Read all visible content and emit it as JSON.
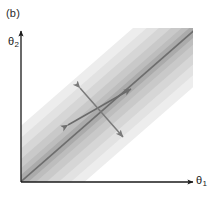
{
  "figure": {
    "panel_label": "(b)",
    "background": "#ffffff",
    "width": 214,
    "height": 198
  },
  "axes": {
    "x_label": "θ",
    "x_label_sub": "1",
    "y_label": "θ",
    "y_label_sub": "2",
    "origin": [
      21,
      182
    ],
    "x_axis_end": [
      193,
      182
    ],
    "y_axis_end": [
      21,
      31
    ],
    "axis_color": "#1a1a1a",
    "axis_width": 1.3,
    "arrowheads": true
  },
  "chart_data": {
    "type": "contour",
    "title": "",
    "xlabel": "θ₁",
    "ylabel": "θ₂",
    "orientation_deg": 45,
    "grid": false,
    "legend": false,
    "ridge_line": {
      "start": [
        24,
        179
      ],
      "end": [
        190,
        34
      ],
      "color": "#6e6e6e",
      "width": 1.6
    },
    "contour_bands": [
      {
        "level": 1,
        "half_width_px": 42,
        "color": "#ededed",
        "label": "outermost"
      },
      {
        "level": 2,
        "half_width_px": 33,
        "color": "#e2e2e2",
        "label": ""
      },
      {
        "level": 3,
        "half_width_px": 25,
        "color": "#d6d6d6",
        "label": ""
      },
      {
        "level": 4,
        "half_width_px": 17,
        "color": "#c9c9c9",
        "label": ""
      },
      {
        "level": 5,
        "half_width_px": 10,
        "color": "#bdbdbd",
        "label": ""
      },
      {
        "level": 6,
        "half_width_px": 5,
        "color": "#ababab",
        "label": "innermost"
      }
    ],
    "arrows": [
      {
        "name": "major-axis-arrow",
        "kind": "double-headed",
        "from": [
          68,
          125
        ],
        "to": [
          131,
          89
        ],
        "color": "#6a6a6a",
        "length_px": 73,
        "angle_deg": 30
      },
      {
        "name": "minor-axis-arrow",
        "kind": "double-headed",
        "from": [
          80,
          88
        ],
        "to": [
          123,
          137
        ],
        "color": "#7a7a7a",
        "length_px": 65,
        "angle_deg": -49
      }
    ]
  }
}
